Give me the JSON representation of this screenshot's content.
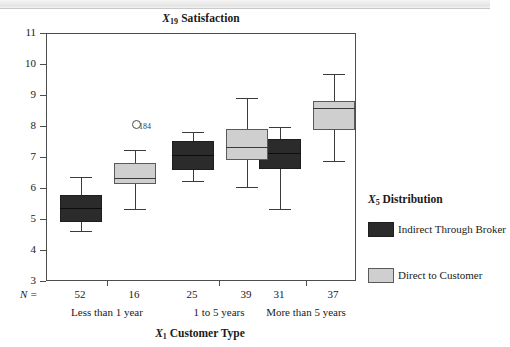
{
  "figure": {
    "title_prefix": "X",
    "title_sub": "19",
    "title_text": "Satisfaction",
    "x_axis_prefix": "X",
    "x_axis_sub": "1",
    "x_axis_text": "Customer Type",
    "n_equals_label": "N ="
  },
  "axis": {
    "y_ticks": [
      "11",
      "10",
      "9",
      "8",
      "7",
      "6",
      "5",
      "4",
      "3"
    ],
    "y_min": 3,
    "y_max": 11
  },
  "legend": {
    "title_prefix": "X",
    "title_sub": "5",
    "title_text": "Distribution",
    "items": [
      {
        "label": "Indirect Through Broker",
        "color": "#2b2b2b",
        "swatch": "dark"
      },
      {
        "label": "Direct to Customer",
        "color": "#cfcfcf",
        "swatch": "light"
      }
    ]
  },
  "groups": [
    {
      "label": "Less than 1 year",
      "n": [
        "52",
        "16"
      ]
    },
    {
      "label": "1 to 5 years",
      "n": [
        "25",
        "39"
      ]
    },
    {
      "label": "More than 5 years",
      "n": [
        "31",
        "37"
      ]
    }
  ],
  "chart_data": {
    "type": "box",
    "xlabel": "X1 Customer Type",
    "ylabel": "",
    "ylim": [
      3,
      11
    ],
    "grid": false,
    "legend_position": "right",
    "categories": [
      "Less than 1 year",
      "1 to 5 years",
      "More than 5 years"
    ],
    "series": [
      {
        "name": "Indirect Through Broker",
        "color": "#2b2b2b",
        "n": [
          52,
          25,
          31
        ],
        "boxes": [
          {
            "category": "Less than 1 year",
            "whisker_low": 4.65,
            "q1": 4.95,
            "median": 5.4,
            "q3": 5.8,
            "whisker_high": 6.4,
            "outliers": []
          },
          {
            "category": "1 to 5 years",
            "whisker_low": 6.25,
            "q1": 6.6,
            "median": 7.1,
            "q3": 7.55,
            "whisker_high": 7.85,
            "outliers": []
          },
          {
            "category": "More than 5 years",
            "whisker_low": 5.35,
            "q1": 6.65,
            "median": 7.15,
            "q3": 7.6,
            "whisker_high": 8.0,
            "outliers": []
          }
        ]
      },
      {
        "name": "Direct to Customer",
        "color": "#cfcfcf",
        "n": [
          16,
          39,
          37
        ],
        "boxes": [
          {
            "category": "Less than 1 year",
            "whisker_low": 5.35,
            "q1": 6.15,
            "median": 6.35,
            "q3": 6.85,
            "whisker_high": 7.25,
            "outliers": [
              {
                "id": "184",
                "value": 8.1
              }
            ]
          },
          {
            "category": "1 to 5 years",
            "whisker_low": 6.05,
            "q1": 6.95,
            "median": 7.35,
            "q3": 7.95,
            "whisker_high": 8.95,
            "outliers": []
          },
          {
            "category": "More than 5 years",
            "whisker_low": 6.9,
            "q1": 7.9,
            "median": 8.6,
            "q3": 8.85,
            "whisker_high": 9.7,
            "outliers": []
          }
        ]
      }
    ]
  }
}
